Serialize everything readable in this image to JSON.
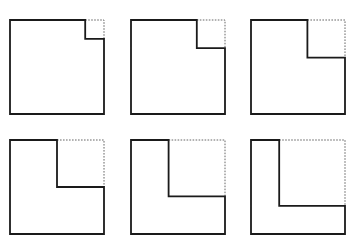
{
  "figure": {
    "rows": 2,
    "columns": 3,
    "colors": {
      "outline": "#1a1a1a",
      "removed_outline": "#555555",
      "background": "#ffffff"
    },
    "panels": [
      {
        "id": 1,
        "notch_fraction": 0.2
      },
      {
        "id": 2,
        "notch_fraction": 0.3
      },
      {
        "id": 3,
        "notch_fraction": 0.4
      },
      {
        "id": 4,
        "notch_fraction": 0.5
      },
      {
        "id": 5,
        "notch_fraction": 0.6
      },
      {
        "id": 6,
        "notch_fraction": 0.7
      }
    ]
  }
}
